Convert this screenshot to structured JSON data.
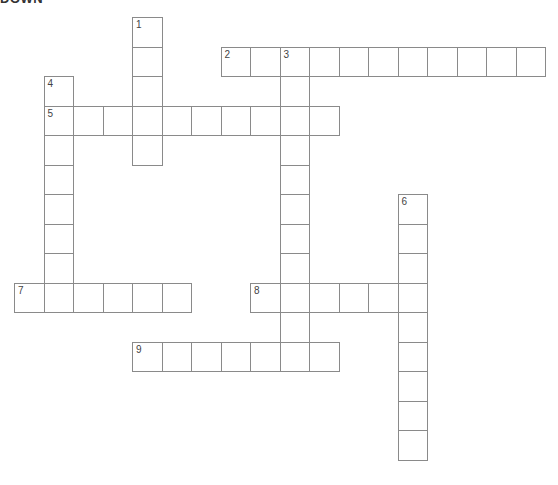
{
  "header": {
    "title": "DOWN"
  },
  "layout": {
    "origin_x": 14,
    "origin_y": 17,
    "cell": 29.5
  },
  "entries": [
    {
      "number": "1",
      "direction": "down",
      "row": 0,
      "col": 4,
      "length": 5
    },
    {
      "number": "2",
      "direction": "across",
      "row": 1,
      "col": 7,
      "length": 11
    },
    {
      "number": "3",
      "direction": "down",
      "row": 1,
      "col": 9,
      "length": 11
    },
    {
      "number": "4",
      "direction": "down",
      "row": 2,
      "col": 1,
      "length": 7
    },
    {
      "number": "5",
      "direction": "across",
      "row": 3,
      "col": 1,
      "length": 10
    },
    {
      "number": "6",
      "direction": "down",
      "row": 6,
      "col": 13,
      "length": 9
    },
    {
      "number": "7",
      "direction": "across",
      "row": 9,
      "col": 0,
      "length": 6
    },
    {
      "number": "8",
      "direction": "across",
      "row": 9,
      "col": 8,
      "length": 6
    },
    {
      "number": "9",
      "direction": "across",
      "row": 11,
      "col": 4,
      "length": 7
    }
  ],
  "colors": {
    "border": "#8a8a8a",
    "background": "#ffffff",
    "number": "#444444"
  }
}
